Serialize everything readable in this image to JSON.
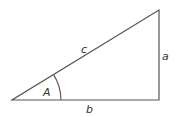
{
  "diagram": {
    "type": "right-triangle",
    "stroke_color": "#555555",
    "labels": {
      "hypotenuse": "c",
      "opposite": "a",
      "adjacent": "b",
      "angle": "A"
    },
    "vertices": {
      "angle_vertex": [
        12,
        100
      ],
      "right_angle_vertex": [
        159,
        100
      ],
      "top_vertex": [
        159,
        10
      ]
    }
  }
}
